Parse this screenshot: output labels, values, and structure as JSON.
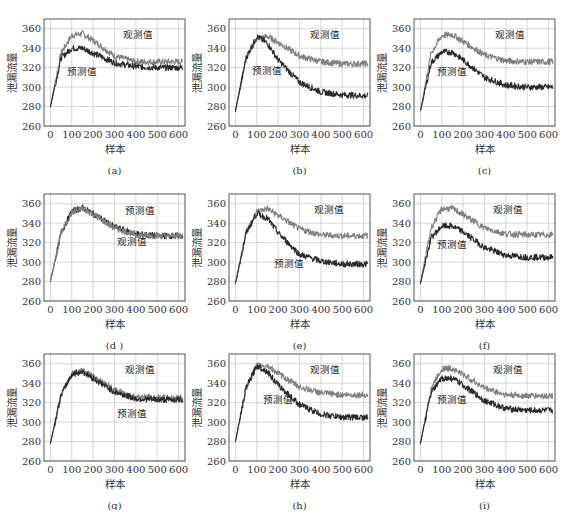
{
  "figure": {
    "layout": {
      "rows": 3,
      "cols": 3
    },
    "shared_axes": {
      "xlabel": "样本",
      "ylabel": "泄漏流量",
      "xlim": [
        -30,
        630
      ],
      "ylim": [
        260,
        370
      ],
      "xticks": [
        0,
        100,
        200,
        300,
        400,
        500,
        600
      ],
      "yticks": [
        260,
        280,
        300,
        320,
        340,
        360
      ],
      "grid": true
    },
    "colors": {
      "observed": "#808080",
      "predicted": "#2a2a2a",
      "axis": "#444444",
      "grid": "#bfbfbf"
    }
  },
  "chart_data": [
    {
      "id": "a",
      "caption": "(a)",
      "type": "line",
      "title": "",
      "xlabel": "样本",
      "ylabel": "泄漏流量",
      "ylim": [
        260,
        370
      ],
      "x": [
        0,
        50,
        100,
        150,
        200,
        300,
        400,
        500,
        620
      ],
      "series": [
        {
          "name": "观测值",
          "values": [
            280,
            335,
            353,
            355,
            348,
            332,
            326,
            326,
            326
          ]
        },
        {
          "name": "预测值",
          "values": [
            280,
            330,
            340,
            340,
            335,
            325,
            321,
            320,
            320
          ]
        }
      ],
      "annotations": [
        {
          "text": "观测值",
          "x": 410,
          "y": 350
        },
        {
          "text": "预测值",
          "x": 150,
          "y": 312
        }
      ]
    },
    {
      "id": "b",
      "caption": "(b)",
      "type": "line",
      "title": "",
      "xlabel": "样本",
      "ylabel": "泄漏流量",
      "ylim": [
        260,
        370
      ],
      "x": [
        0,
        50,
        100,
        150,
        200,
        300,
        400,
        500,
        620
      ],
      "series": [
        {
          "name": "观测值",
          "values": [
            275,
            330,
            350,
            352,
            346,
            332,
            326,
            324,
            324
          ]
        },
        {
          "name": "预测值",
          "values": [
            275,
            330,
            352,
            345,
            328,
            305,
            295,
            292,
            291
          ]
        }
      ],
      "annotations": [
        {
          "text": "观测值",
          "x": 420,
          "y": 350
        },
        {
          "text": "预测值",
          "x": 150,
          "y": 313
        }
      ]
    },
    {
      "id": "c",
      "caption": "(c)",
      "type": "line",
      "title": "",
      "xlabel": "样本",
      "ylabel": "泄漏流量",
      "ylim": [
        260,
        370
      ],
      "x": [
        0,
        50,
        100,
        150,
        200,
        300,
        400,
        500,
        620
      ],
      "series": [
        {
          "name": "观测值",
          "values": [
            275,
            335,
            353,
            354,
            347,
            333,
            327,
            326,
            326
          ]
        },
        {
          "name": "预测值",
          "values": [
            275,
            325,
            336,
            336,
            328,
            310,
            302,
            300,
            300
          ]
        }
      ],
      "annotations": [
        {
          "text": "观测值",
          "x": 420,
          "y": 350
        },
        {
          "text": "预测值",
          "x": 150,
          "y": 312
        }
      ]
    },
    {
      "id": "d",
      "caption": "(d )",
      "type": "line",
      "title": "",
      "xlabel": "样本",
      "ylabel": "泄漏流量",
      "ylim": [
        260,
        370
      ],
      "x": [
        0,
        50,
        100,
        150,
        200,
        300,
        400,
        500,
        620
      ],
      "series": [
        {
          "name": "预测值",
          "values": [
            280,
            330,
            352,
            356,
            350,
            336,
            329,
            327,
            327
          ]
        },
        {
          "name": "观测值",
          "values": [
            280,
            330,
            351,
            355,
            349,
            335,
            328,
            327,
            327
          ]
        }
      ],
      "annotations": [
        {
          "text": "预测值",
          "x": 420,
          "y": 349
        },
        {
          "text": "观测值",
          "x": 380,
          "y": 318
        }
      ]
    },
    {
      "id": "e",
      "caption": "(e)",
      "type": "line",
      "title": "",
      "xlabel": "样本",
      "ylabel": "泄漏流量",
      "ylim": [
        260,
        370
      ],
      "x": [
        0,
        50,
        100,
        150,
        200,
        300,
        400,
        500,
        620
      ],
      "series": [
        {
          "name": "观测值",
          "values": [
            278,
            330,
            352,
            355,
            348,
            334,
            328,
            327,
            327
          ]
        },
        {
          "name": "预测值",
          "values": [
            278,
            330,
            350,
            345,
            330,
            308,
            301,
            298,
            298
          ]
        }
      ],
      "annotations": [
        {
          "text": "观测值",
          "x": 440,
          "y": 350
        },
        {
          "text": "预测值",
          "x": 250,
          "y": 295
        }
      ]
    },
    {
      "id": "f",
      "caption": "(f)",
      "type": "line",
      "title": "",
      "xlabel": "样本",
      "ylabel": "泄漏流量",
      "ylim": [
        260,
        370
      ],
      "x": [
        0,
        50,
        100,
        150,
        200,
        300,
        400,
        500,
        620
      ],
      "series": [
        {
          "name": "观测值",
          "values": [
            278,
            335,
            355,
            355,
            349,
            335,
            329,
            328,
            328
          ]
        },
        {
          "name": "预测值",
          "values": [
            278,
            325,
            337,
            337,
            331,
            315,
            307,
            305,
            305
          ]
        }
      ],
      "annotations": [
        {
          "text": "观测值",
          "x": 410,
          "y": 350
        },
        {
          "text": "预测值",
          "x": 150,
          "y": 314
        }
      ]
    },
    {
      "id": "g",
      "caption": "(g)",
      "type": "line",
      "title": "",
      "xlabel": "样本",
      "ylabel": "泄漏流量",
      "ylim": [
        260,
        370
      ],
      "x": [
        0,
        50,
        100,
        150,
        200,
        300,
        400,
        500,
        620
      ],
      "series": [
        {
          "name": "观测值",
          "values": [
            278,
            328,
            350,
            353,
            347,
            333,
            326,
            325,
            325
          ]
        },
        {
          "name": "预测值",
          "values": [
            278,
            328,
            349,
            352,
            345,
            331,
            324,
            323,
            323
          ]
        }
      ],
      "annotations": [
        {
          "text": "观测值",
          "x": 420,
          "y": 350
        },
        {
          "text": "预测值",
          "x": 380,
          "y": 305
        }
      ]
    },
    {
      "id": "h",
      "caption": "(h)",
      "type": "line",
      "title": "",
      "xlabel": "样本",
      "ylabel": "泄漏流量",
      "ylim": [
        260,
        370
      ],
      "x": [
        0,
        50,
        100,
        150,
        200,
        300,
        400,
        500,
        620
      ],
      "series": [
        {
          "name": "观测值",
          "values": [
            280,
            335,
            358,
            358,
            350,
            336,
            330,
            328,
            328
          ]
        },
        {
          "name": "预测值",
          "values": [
            280,
            335,
            358,
            352,
            338,
            318,
            308,
            305,
            305
          ]
        }
      ],
      "annotations": [
        {
          "text": "观测值",
          "x": 420,
          "y": 350
        },
        {
          "text": "预测值",
          "x": 200,
          "y": 320
        }
      ]
    },
    {
      "id": "i",
      "caption": "(i)",
      "type": "line",
      "title": "",
      "xlabel": "样本",
      "ylabel": "泄漏流量",
      "ylim": [
        260,
        370
      ],
      "x": [
        0,
        50,
        100,
        150,
        200,
        300,
        400,
        500,
        620
      ],
      "series": [
        {
          "name": "观测值",
          "values": [
            278,
            335,
            355,
            355,
            349,
            335,
            328,
            327,
            327
          ]
        },
        {
          "name": "预测值",
          "values": [
            278,
            330,
            345,
            345,
            338,
            322,
            314,
            312,
            312
          ]
        }
      ],
      "annotations": [
        {
          "text": "观测值",
          "x": 410,
          "y": 350
        },
        {
          "text": "预测值",
          "x": 150,
          "y": 320
        }
      ]
    }
  ]
}
